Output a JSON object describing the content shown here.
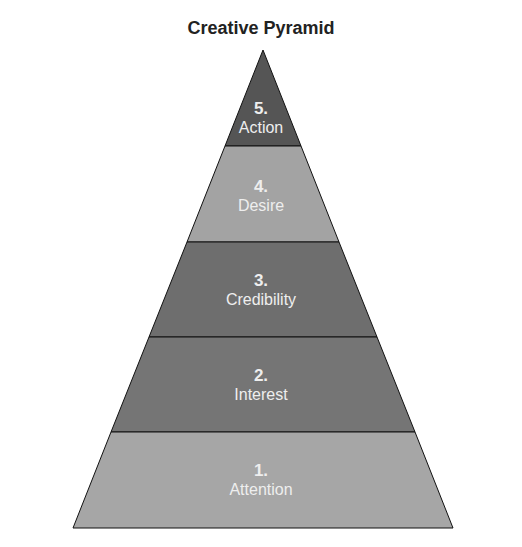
{
  "title": "Creative Pyramid",
  "levels": [
    {
      "number": "5.",
      "label": "Action",
      "color": "#555555"
    },
    {
      "number": "4.",
      "label": "Desire",
      "color": "#a3a3a3"
    },
    {
      "number": "3.",
      "label": "Credibility",
      "color": "#6e6e6e"
    },
    {
      "number": "2.",
      "label": "Interest",
      "color": "#757575"
    },
    {
      "number": "1.",
      "label": "Attention",
      "color": "#a6a6a6"
    }
  ]
}
